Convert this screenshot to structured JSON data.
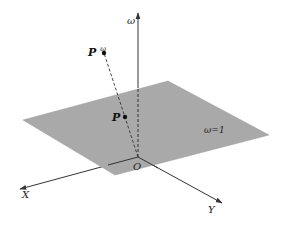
{
  "diagram": {
    "type": "3d-coordinate-projection",
    "colors": {
      "background": "#ffffff",
      "plane_fill": "#a9a9a9",
      "line": "#333333",
      "text": "#222222"
    },
    "axes": {
      "omega": {
        "label": "ω"
      },
      "x": {
        "label": "X"
      },
      "y": {
        "label": "Y"
      },
      "origin": {
        "label": "O"
      }
    },
    "plane": {
      "label": "ω=1"
    },
    "points": {
      "p_omega": {
        "label": "P",
        "superscript": "ω"
      },
      "p": {
        "label": "P"
      }
    }
  }
}
